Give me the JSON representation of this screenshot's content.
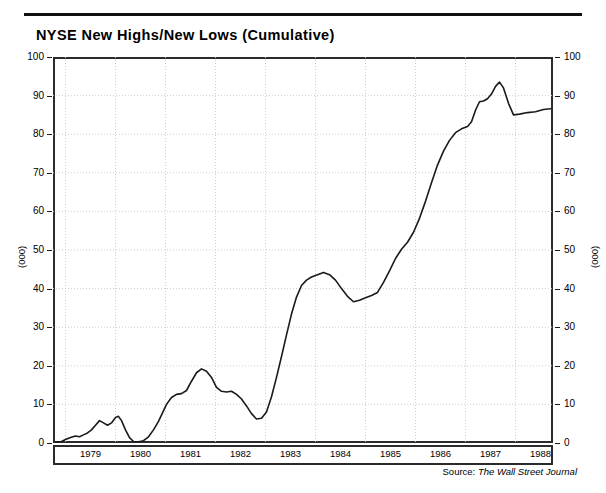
{
  "header": {
    "title": "NYSE New Highs/New Lows (Cumulative)"
  },
  "footer": {
    "source_label": "Source:",
    "source_name": "The Wall Street Journal"
  },
  "axes": {
    "y_unit_left": "(000)",
    "y_unit_right": "(000)",
    "y_ticks": [
      "0",
      "10",
      "20",
      "30",
      "40",
      "50",
      "60",
      "70",
      "80",
      "90",
      "100"
    ],
    "x_ticks": [
      "1979",
      "1980",
      "1981",
      "1982",
      "1983",
      "1984",
      "1985",
      "1986",
      "1987",
      "1988"
    ]
  },
  "style": {
    "line_color": "#1a1a1a",
    "frame_color": "#2b2b2b",
    "grid_color": "#c8c8c8",
    "background": "#ffffff"
  },
  "chart_data": {
    "type": "line",
    "title": "NYSE New Highs/New Lows (Cumulative)",
    "subtitle": "",
    "xlabel": "",
    "ylabel": "(000)",
    "xlim": [
      1978.75,
      1988.75
    ],
    "ylim": [
      0,
      100
    ],
    "grid": true,
    "legend": false,
    "y_unit": "thousands",
    "series": [
      {
        "name": "NYSE New Highs/New Lows (Cumulative)",
        "x": [
          1978.8,
          1978.92,
          1979.0,
          1979.1,
          1979.2,
          1979.28,
          1979.36,
          1979.44,
          1979.52,
          1979.6,
          1979.68,
          1979.76,
          1979.84,
          1979.92,
          1980.0,
          1980.06,
          1980.12,
          1980.2,
          1980.28,
          1980.36,
          1980.46,
          1980.56,
          1980.66,
          1980.76,
          1980.86,
          1980.94,
          1981.02,
          1981.12,
          1981.22,
          1981.32,
          1981.42,
          1981.52,
          1981.62,
          1981.72,
          1981.82,
          1981.92,
          1982.02,
          1982.12,
          1982.22,
          1982.32,
          1982.42,
          1982.52,
          1982.62,
          1982.72,
          1982.82,
          1982.92,
          1983.02,
          1983.12,
          1983.22,
          1983.32,
          1983.42,
          1983.52,
          1983.62,
          1983.72,
          1983.82,
          1983.92,
          1984.04,
          1984.16,
          1984.28,
          1984.4,
          1984.52,
          1984.64,
          1984.76,
          1984.88,
          1985.0,
          1985.12,
          1985.24,
          1985.36,
          1985.48,
          1985.6,
          1985.72,
          1985.84,
          1985.96,
          1986.08,
          1986.2,
          1986.32,
          1986.44,
          1986.56,
          1986.68,
          1986.8,
          1986.92,
          1987.04,
          1987.12,
          1987.2,
          1987.28,
          1987.36,
          1987.44,
          1987.52,
          1987.6,
          1987.68,
          1987.76,
          1987.86,
          1987.96,
          1988.08,
          1988.24,
          1988.4,
          1988.56,
          1988.7
        ],
        "y": [
          0.2,
          0.4,
          0.9,
          1.4,
          1.8,
          1.6,
          2.1,
          2.6,
          3.4,
          4.6,
          5.8,
          5.2,
          4.6,
          5.2,
          6.6,
          6.9,
          5.8,
          3.4,
          1.4,
          0.4,
          0.3,
          0.6,
          1.6,
          3.4,
          5.6,
          7.8,
          10.0,
          11.8,
          12.6,
          12.8,
          13.6,
          16.0,
          18.2,
          19.2,
          18.6,
          17.0,
          14.4,
          13.4,
          13.2,
          13.4,
          12.6,
          11.4,
          9.6,
          7.6,
          6.2,
          6.4,
          8.0,
          12.0,
          17.0,
          22.4,
          28.0,
          33.4,
          37.8,
          40.8,
          42.2,
          43.0,
          43.6,
          44.2,
          43.6,
          42.2,
          40.0,
          38.0,
          36.6,
          37.0,
          37.6,
          38.2,
          39.0,
          41.6,
          44.6,
          47.8,
          50.2,
          52.0,
          54.6,
          58.2,
          62.6,
          67.4,
          72.0,
          75.6,
          78.4,
          80.4,
          81.4,
          82.0,
          83.2,
          86.2,
          88.4,
          88.6,
          89.2,
          90.4,
          92.4,
          93.5,
          92.0,
          88.0,
          85.0,
          85.2,
          85.6,
          85.8,
          86.4,
          86.6
        ]
      }
    ]
  }
}
